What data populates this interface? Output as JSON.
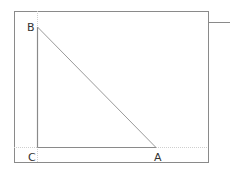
{
  "diagram": {
    "type": "right-triangle",
    "vertices": [
      {
        "label": "A",
        "x": 156,
        "y": 147
      },
      {
        "label": "B",
        "x": 37,
        "y": 27
      },
      {
        "label": "C",
        "x": 37,
        "y": 147
      }
    ],
    "right_angle_at": "C",
    "colors": {
      "frame": "#888888",
      "triangle": "#999999",
      "guide": "#cccccc",
      "label": "#333333"
    }
  }
}
